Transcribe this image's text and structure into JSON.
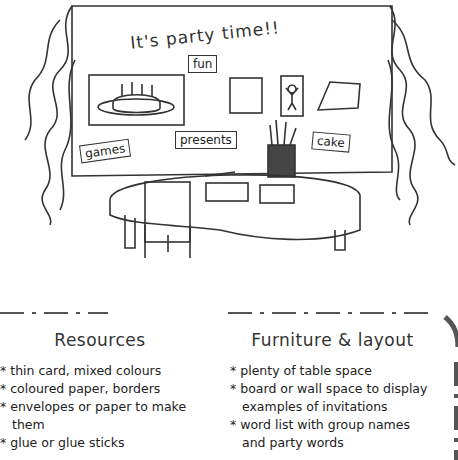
{
  "illustration": {
    "board_title": "It's party time!!",
    "word_cards": [
      "fun",
      "games",
      "presents",
      "cake"
    ],
    "greeting_card_text": "happy birthday",
    "invitation_card_text": "Invitation"
  },
  "resources": {
    "heading": "Resources",
    "items": [
      "thin card, mixed colours",
      "coloured paper, borders",
      "envelopes or paper to make them",
      "glue or glue sticks"
    ]
  },
  "furniture": {
    "heading": "Furniture & layout",
    "items": [
      "plenty of table space",
      "board or wall space to display examples of invitations",
      "word list with group names and party words"
    ]
  }
}
